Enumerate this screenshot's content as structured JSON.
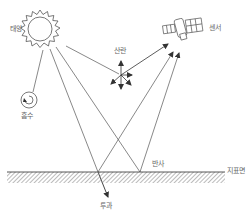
{
  "diagram": {
    "type": "remote-sensing-energy-interaction",
    "labels": {
      "sun": "태양",
      "sensor": "센서",
      "scattering": "산란",
      "absorption": "흡수",
      "reflection": "반사",
      "surface": "지표면",
      "transmission": "투과"
    },
    "colors": {
      "line": "#555555",
      "text": "#666666",
      "background": "#ffffff"
    }
  }
}
